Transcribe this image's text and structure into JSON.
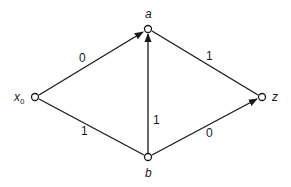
{
  "graph": {
    "nodes": {
      "x0": {
        "label": "x",
        "subscript": "0"
      },
      "a": {
        "label": "a"
      },
      "b": {
        "label": "b"
      },
      "z": {
        "label": "z"
      }
    },
    "edges": [
      {
        "from": "x0",
        "to": "a",
        "weight": "0",
        "directed": true
      },
      {
        "from": "x0",
        "to": "b",
        "weight": "1",
        "directed": false
      },
      {
        "from": "b",
        "to": "a",
        "weight": "1",
        "directed": true
      },
      {
        "from": "a",
        "to": "z",
        "weight": "1",
        "directed": false
      },
      {
        "from": "b",
        "to": "z",
        "weight": "0",
        "directed": true
      }
    ]
  }
}
